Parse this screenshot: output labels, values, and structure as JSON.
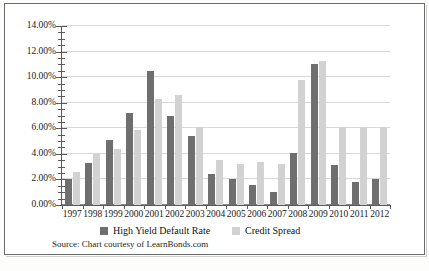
{
  "chart_data": {
    "type": "bar",
    "title": "",
    "subtitle": "",
    "xlabel": "",
    "ylabel": "",
    "ylim": [
      0,
      14
    ],
    "y_tick_values": [
      0,
      2,
      4,
      6,
      8,
      10,
      12,
      14
    ],
    "y_tick_labels": [
      "0.00%",
      "2.00%",
      "4.00%",
      "6.00%",
      "8.00%",
      "10.00%",
      "12.00%",
      "14.00%"
    ],
    "y_minor_tick_step": 0.5,
    "grid": true,
    "grid_axis": "y",
    "legend_position": "below-axis",
    "value_unit": "percent",
    "categories": [
      "1997",
      "1998",
      "1999",
      "2000",
      "2001",
      "2002",
      "2003",
      "2004",
      "2005",
      "2006",
      "2007",
      "2008",
      "2009",
      "2010",
      "2011",
      "2012"
    ],
    "series": [
      {
        "name": "High Yield Default Rate",
        "color": "#6f6f6f",
        "values": [
          2.0,
          3.3,
          5.1,
          7.2,
          10.5,
          7.0,
          5.4,
          2.4,
          2.0,
          1.6,
          1.0,
          4.1,
          11.0,
          3.1,
          1.8,
          2.0
        ]
      },
      {
        "name": "Credit Spread",
        "color": "#d2d2d2",
        "values": [
          2.6,
          4.0,
          4.4,
          5.9,
          8.3,
          8.6,
          6.1,
          3.5,
          3.2,
          3.4,
          3.2,
          9.8,
          11.3,
          6.1,
          6.1,
          6.1
        ]
      }
    ],
    "source_note": "Source: Chart courtesy of LearnBonds.com"
  },
  "legend": {
    "entries": [
      {
        "label": "High Yield Default Rate",
        "swatch": "hy"
      },
      {
        "label": "Credit Spread",
        "swatch": "cs"
      }
    ]
  },
  "source": {
    "text": "Source: Chart courtesy of LearnBonds.com"
  },
  "colors": {
    "high_yield_default_rate": "#6f6f6f",
    "credit_spread": "#d2d2d2",
    "gridline": "#d8d8d8",
    "axis": "#5a5a5a",
    "frame": "#6b6b6b"
  }
}
